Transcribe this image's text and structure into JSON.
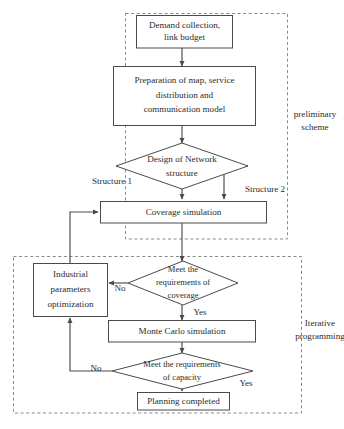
{
  "figure": {
    "type": "flowchart",
    "width": 344,
    "height": 429,
    "background": "#ffffff",
    "line_color": "#4a4a4a",
    "dashed_group_color": "#8a8a8a",
    "text_color": "#2b2b2b"
  },
  "nodes": {
    "demand": {
      "shape": "rect",
      "lines": [
        "Demand collection,",
        "link budget"
      ]
    },
    "preparation": {
      "shape": "rect",
      "lines": [
        "Preparation of map, service",
        "distribution and",
        "communication model"
      ]
    },
    "design": {
      "shape": "diamond",
      "lines": [
        "Design of Network",
        "structure"
      ]
    },
    "coverage_sim": {
      "shape": "rect",
      "lines": [
        "Coverage simulation"
      ]
    },
    "industrial": {
      "shape": "rect",
      "lines": [
        "Industrial",
        "parameters",
        "optimization"
      ]
    },
    "coverage_check": {
      "shape": "diamond",
      "lines": [
        "Meet the",
        "requirements of",
        "coverage"
      ]
    },
    "monte_carlo": {
      "shape": "rect",
      "lines": [
        "Monte Carlo simulation"
      ]
    },
    "capacity_check": {
      "shape": "diamond",
      "lines": [
        "Meet the requirements",
        "of capacity"
      ]
    },
    "planning_done": {
      "shape": "rect",
      "lines": [
        "Planning completed"
      ]
    }
  },
  "edge_labels": {
    "structure_1": "Structure 1",
    "structure_2": "Structure 2",
    "coverage_no": "No",
    "coverage_yes": "Yes",
    "capacity_no": "No",
    "capacity_yes": "Yes"
  },
  "groups": {
    "preliminary": {
      "lines": [
        "preliminary",
        "scheme"
      ]
    },
    "iterative": {
      "lines": [
        "Iterative",
        "programming"
      ]
    }
  }
}
